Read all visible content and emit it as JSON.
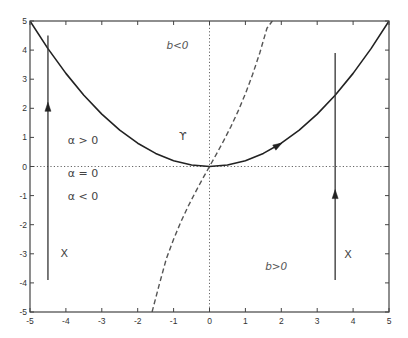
{
  "chart_data": {
    "type": "line",
    "title": "",
    "xlabel": "",
    "ylabel": "",
    "xlim": [
      -5,
      5
    ],
    "ylim": [
      -5,
      5
    ],
    "xticks": [
      -5,
      -4,
      -3,
      -2,
      -1,
      0,
      1,
      2,
      3,
      4,
      5
    ],
    "yticks": [
      -5,
      -4,
      -3,
      -2,
      -1,
      0,
      1,
      2,
      3,
      4,
      5
    ],
    "xtick_labels": [
      "-5",
      "-4",
      "-3",
      "-2",
      "-1",
      "0",
      "1",
      "2",
      "3",
      "4",
      "5"
    ],
    "ytick_labels": [
      "-5",
      "-4",
      "-3",
      "-2",
      "-1",
      "0",
      "1",
      "2",
      "3",
      "4",
      "5"
    ],
    "grid": false,
    "zero_lines": {
      "x": 0,
      "y": 0,
      "style": "dotted"
    },
    "series": [
      {
        "name": "Upsilon curve",
        "style": "solid",
        "color": "#222222",
        "x": [
          -5,
          -4.5,
          -4,
          -3.5,
          -3,
          -2.5,
          -2,
          -1.5,
          -1,
          -0.5,
          0,
          0.5,
          1,
          1.5,
          2,
          2.5,
          3,
          3.5,
          4,
          4.5,
          5
        ],
        "y": [
          5,
          4.05,
          3.2,
          2.45,
          1.8,
          1.25,
          0.8,
          0.45,
          0.2,
          0.05,
          0,
          0.05,
          0.2,
          0.45,
          0.8,
          1.25,
          1.8,
          2.45,
          3.2,
          4.05,
          5
        ],
        "arrow": {
          "x": 1.9,
          "y": 0.72,
          "direction": "right"
        }
      },
      {
        "name": "dashed boundary",
        "style": "dashed",
        "color": "#555555",
        "x": [
          -1.6,
          -1.4,
          -1.2,
          -1.0,
          -0.8,
          -0.6,
          -0.4,
          -0.2,
          0,
          0.2,
          0.4,
          0.6,
          0.8,
          1.0,
          1.2,
          1.4,
          1.6,
          1.75
        ],
        "y": [
          -5.0,
          -4.06,
          -3.16,
          -2.5,
          -1.91,
          -1.38,
          -0.9,
          -0.44,
          0,
          0.44,
          0.9,
          1.38,
          1.91,
          2.5,
          3.16,
          3.9,
          4.75,
          5.0
        ]
      },
      {
        "name": "left trajectory X",
        "style": "solid",
        "color": "#333333",
        "x": [
          -4.5,
          -4.5
        ],
        "y": [
          -3.9,
          4.5
        ],
        "arrow": {
          "x": -4.5,
          "y": 2.0,
          "direction": "up"
        }
      },
      {
        "name": "right trajectory X",
        "style": "solid",
        "color": "#333333",
        "x": [
          3.5,
          3.5
        ],
        "y": [
          -3.9,
          3.9
        ],
        "arrow": {
          "x": 3.5,
          "y": -1.0,
          "direction": "up"
        }
      }
    ],
    "annotations": [
      {
        "text": "b<0",
        "x": -1.2,
        "y": 4.05,
        "style": "italic"
      },
      {
        "text": "ϒ",
        "x": -0.85,
        "y": 0.9,
        "style": "normal"
      },
      {
        "text": "α > 0",
        "x": -3.95,
        "y": 0.78,
        "style": "normal"
      },
      {
        "text": "α = 0",
        "x": -3.95,
        "y": -0.35,
        "style": "normal"
      },
      {
        "text": "α < 0",
        "x": -3.95,
        "y": -1.15,
        "style": "normal"
      },
      {
        "text": "X",
        "x": -4.15,
        "y": -3.12,
        "style": "normal"
      },
      {
        "text": "X",
        "x": 3.75,
        "y": -3.15,
        "style": "normal"
      },
      {
        "text": "b>0",
        "x": 1.55,
        "y": -3.55,
        "style": "italic"
      }
    ],
    "legend": "none"
  }
}
